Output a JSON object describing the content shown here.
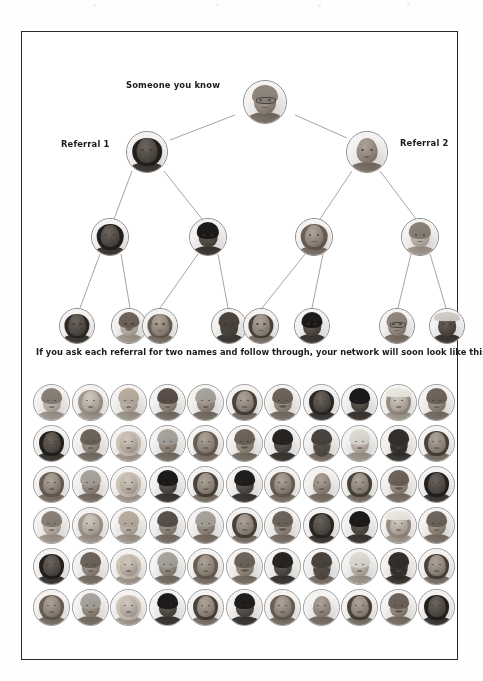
{
  "page": {
    "background_color": "#ffffff",
    "frame_color": "#2a2a2a",
    "width": 483,
    "height": 681
  },
  "diagram": {
    "type": "referral-network-tree",
    "labels": {
      "root": "Someone you know",
      "referral_left": "Referral 1",
      "referral_right": "Referral 2"
    },
    "line_color": "#8d8d8d",
    "node_border_color": "#8d8d8d",
    "levels": [
      {
        "level": 1,
        "count": 1,
        "diameter": 44,
        "cy": 70,
        "nodes": [
          {
            "cx": 243,
            "tone": "mid",
            "kind": "man-glasses"
          }
        ]
      },
      {
        "level": 2,
        "count": 2,
        "diameter": 42,
        "cy": 120,
        "nodes": [
          {
            "cx": 125,
            "tone": "dark",
            "kind": "woman-dark-hair"
          },
          {
            "cx": 345,
            "tone": "mid",
            "kind": "man-bald"
          }
        ]
      },
      {
        "level": 3,
        "count": 4,
        "diameter": 38,
        "cy": 205,
        "nodes": [
          {
            "cx": 88,
            "tone": "dark",
            "kind": "woman-dark-hair"
          },
          {
            "cx": 186,
            "tone": "dark",
            "kind": "man-dark-skin"
          },
          {
            "cx": 292,
            "tone": "mid",
            "kind": "woman-smiling"
          },
          {
            "cx": 398,
            "tone": "light",
            "kind": "man-light"
          }
        ]
      },
      {
        "level": 4,
        "count": 8,
        "diameter": 36,
        "cy": 293,
        "nodes": [
          {
            "cx": 55,
            "tone": "dark",
            "kind": "woman-curly"
          },
          {
            "cx": 107,
            "tone": "light",
            "kind": "man-moustache"
          },
          {
            "cx": 135,
            "tone": "mid",
            "kind": "woman-smiling"
          },
          {
            "cx": 208,
            "tone": "dark",
            "kind": "man-beard"
          },
          {
            "cx": 237,
            "tone": "mid",
            "kind": "woman-long-hair"
          },
          {
            "cx": 290,
            "tone": "dark",
            "kind": "man-dark-skin"
          },
          {
            "cx": 375,
            "tone": "mid",
            "kind": "man-glasses"
          },
          {
            "cx": 426,
            "tone": "dark",
            "kind": "man-cap"
          }
        ]
      }
    ],
    "edges": [
      {
        "from": "L1N0",
        "to": "L2N0"
      },
      {
        "from": "L1N0",
        "to": "L2N1"
      },
      {
        "from": "L2N0",
        "to": "L3N0"
      },
      {
        "from": "L2N0",
        "to": "L3N1"
      },
      {
        "from": "L2N1",
        "to": "L3N2"
      },
      {
        "from": "L2N1",
        "to": "L3N3"
      },
      {
        "from": "L3N0",
        "to": "L4N0"
      },
      {
        "from": "L3N0",
        "to": "L4N1"
      },
      {
        "from": "L3N1",
        "to": "L4N2"
      },
      {
        "from": "L3N1",
        "to": "L4N3"
      },
      {
        "from": "L3N2",
        "to": "L4N4"
      },
      {
        "from": "L3N2",
        "to": "L4N5"
      },
      {
        "from": "L3N3",
        "to": "L4N6"
      },
      {
        "from": "L3N3",
        "to": "L4N7"
      }
    ]
  },
  "caption": {
    "text": "If you ask each referral for two names and follow through, your network will soon look like this:"
  },
  "grid": {
    "columns": 11,
    "rows": 6,
    "total_portraits": 66,
    "cell_diameter": 37,
    "col_pitch": 38.5,
    "row_pitch": 41,
    "border_color": "#9a9a9a",
    "cells": [
      [
        "man-light",
        "woman-pale",
        "man-blond",
        "woman-short-hair",
        "man-grey",
        "woman-long-hair",
        "man-moustache",
        "woman-curly",
        "man-dark-skin",
        "woman-hat",
        "man-young"
      ],
      [
        "woman-dark-hair",
        "man-young",
        "woman-blonde",
        "man-grey",
        "woman-smiling",
        "man-moustache",
        "woman-updo",
        "man-beard",
        "man-white-hair",
        "man-beard-dark",
        "woman-long-hair"
      ],
      [
        "woman-smiling",
        "man-grey",
        "woman-blonde",
        "man-dark-skin",
        "woman-long-hair",
        "man-dark-curly",
        "woman-smiling",
        "man-bald",
        "woman-long-hair",
        "man-moustache",
        "woman-dark-hair"
      ],
      [
        "man-light",
        "woman-pale",
        "man-blond",
        "woman-short-hair",
        "man-grey",
        "woman-long-hair",
        "man-moustache",
        "woman-curly",
        "man-dark-skin",
        "woman-hat",
        "man-young"
      ],
      [
        "woman-dark-hair",
        "man-young",
        "woman-blonde",
        "man-grey",
        "woman-smiling",
        "man-moustache",
        "woman-updo",
        "man-beard",
        "man-white-hair",
        "man-beard-dark",
        "woman-long-hair"
      ],
      [
        "woman-smiling",
        "man-grey",
        "woman-blonde",
        "man-dark-skin",
        "woman-long-hair",
        "man-dark-curly",
        "woman-smiling",
        "man-bald",
        "woman-long-hair",
        "man-moustache",
        "woman-dark-hair"
      ]
    ]
  }
}
